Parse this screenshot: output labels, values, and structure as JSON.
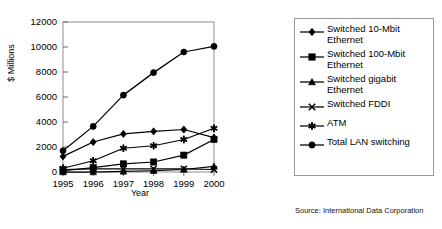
{
  "figure": {
    "source_note": "Source: International Data Corporation"
  },
  "chart_data": {
    "type": "line",
    "title": "",
    "xlabel": "Year",
    "ylabel": "$ Millions",
    "categories": [
      "1995",
      "1996",
      "1997",
      "1998",
      "1999",
      "2000"
    ],
    "x": [
      1995,
      1996,
      1997,
      1998,
      1999,
      2000
    ],
    "xlim": [
      1995,
      2000
    ],
    "ylim": [
      0,
      12000
    ],
    "yticks": [
      0,
      2000,
      4000,
      6000,
      8000,
      10000,
      12000
    ],
    "ytick_labels": [
      "0",
      "2000",
      "4000",
      "6000",
      "8000",
      "10000",
      "12000"
    ],
    "xtick_labels": [
      "1995",
      "1996",
      "1997",
      "1998",
      "1999",
      "2000"
    ],
    "grid": false,
    "legend_position": "right",
    "series": [
      {
        "name": "Switched 10-Mbit\nEthernet",
        "marker": "diamond",
        "color": "#000000",
        "values": [
          1250,
          2400,
          3050,
          3250,
          3400,
          2750
        ]
      },
      {
        "name": "Switched 100-Mbit\nEthernet",
        "marker": "square",
        "color": "#000000",
        "values": [
          100,
          350,
          650,
          800,
          1350,
          2600
        ]
      },
      {
        "name": "Switched gigabit\nEthernet",
        "marker": "triangle",
        "color": "#000000",
        "values": [
          0,
          0,
          50,
          100,
          200,
          450
        ]
      },
      {
        "name": "Switched FDDI",
        "marker": "cross",
        "color": "#000000",
        "values": [
          200,
          250,
          250,
          250,
          250,
          200
        ]
      },
      {
        "name": "ATM",
        "marker": "star",
        "color": "#000000",
        "values": [
          300,
          900,
          1900,
          2100,
          2600,
          3500
        ]
      },
      {
        "name": "Total LAN switching",
        "marker": "circle",
        "color": "#000000",
        "values": [
          1700,
          3650,
          6150,
          7950,
          9600,
          10050
        ]
      }
    ]
  }
}
